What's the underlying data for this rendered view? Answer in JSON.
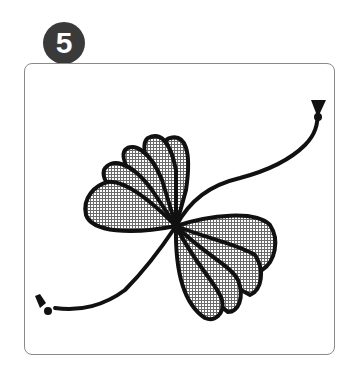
{
  "step_badge": {
    "number": "5",
    "background": "#3a3a3a",
    "text_color": "#ffffff"
  },
  "illustration": {
    "description": "Fan-folded paper bow tied at its center with a cord that has knotted ends",
    "elements": [
      "folded-fan-upper-left",
      "folded-fan-lower-right",
      "cord-to-upper-right",
      "cord-to-lower-left",
      "knot-upper-right",
      "knot-lower-left"
    ],
    "outline_color": "#111111",
    "fill_pattern": "halftone-grid"
  },
  "frame": {
    "border_color": "#8a8a8a",
    "corner_radius": 8
  }
}
